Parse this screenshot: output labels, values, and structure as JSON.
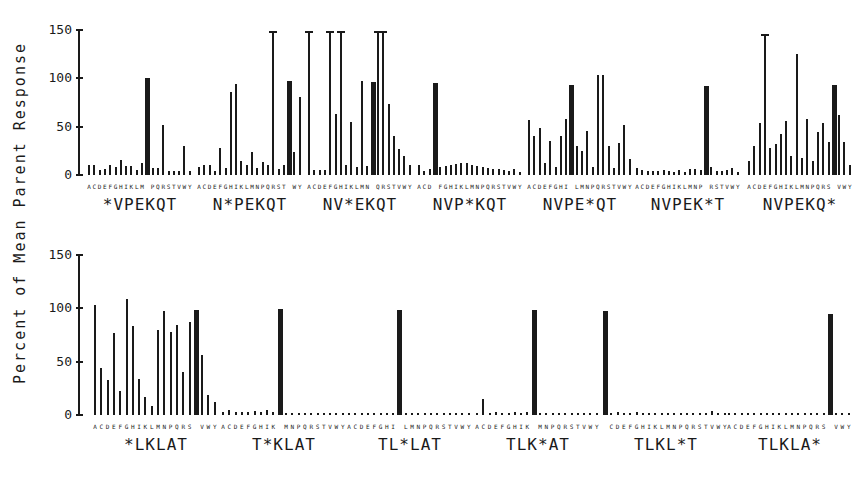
{
  "y_axis_label": "Percent of Mean Parent Response",
  "y_ticks": [
    "0",
    "50",
    "100",
    "150"
  ],
  "amino_acids": [
    "A",
    "C",
    "D",
    "E",
    "F",
    "G",
    "H",
    "I",
    "K",
    "L",
    "M",
    "N",
    "P",
    "Q",
    "R",
    "S",
    "T",
    "V",
    "W",
    "Y"
  ],
  "chart_data": {
    "type": "bar",
    "title": "",
    "ylabel": "Percent of Mean Parent Response",
    "xlabel": "",
    "ylim": [
      0,
      150
    ],
    "grid": false,
    "categories": [
      "A",
      "C",
      "D",
      "E",
      "F",
      "G",
      "H",
      "I",
      "K",
      "L",
      "M",
      "N",
      "P",
      "Q",
      "R",
      "S",
      "T",
      "V",
      "W",
      "Y"
    ],
    "panels": [
      {
        "row": 1,
        "label": "*VPEKQT",
        "native": "N",
        "values": [
          10,
          10,
          5,
          6,
          10,
          8,
          15,
          9,
          9,
          5,
          12,
          100,
          7,
          7,
          52,
          4,
          4,
          4,
          30,
          4
        ]
      },
      {
        "row": 1,
        "label": "N*PEKQT",
        "native": "V",
        "values": [
          8,
          10,
          10,
          4,
          28,
          7,
          86,
          94,
          14,
          10,
          24,
          7,
          13,
          10,
          148,
          6,
          10,
          97,
          24,
          80
        ]
      },
      {
        "row": 1,
        "label": "NV*EKQT",
        "native": "P",
        "values": [
          148,
          5,
          5,
          5,
          148,
          63,
          148,
          10,
          55,
          8,
          97,
          9,
          96,
          148,
          148,
          73,
          40,
          27,
          20,
          10
        ]
      },
      {
        "row": 1,
        "label": "NVP*KQT",
        "native": "E",
        "values": [
          10,
          4,
          6,
          95,
          8,
          9,
          10,
          11,
          12,
          12,
          10,
          9,
          8,
          7,
          6,
          6,
          5,
          4,
          6,
          3
        ]
      },
      {
        "row": 1,
        "label": "NVPE*QT",
        "native": "K",
        "values": [
          57,
          40,
          48,
          12,
          35,
          8,
          40,
          58,
          93,
          30,
          25,
          45,
          8,
          103,
          103,
          30,
          7,
          33,
          52,
          17
        ]
      },
      {
        "row": 1,
        "label": "NVPEK*T",
        "native": "Q",
        "values": [
          7,
          5,
          4,
          4,
          4,
          5,
          4,
          3,
          5,
          3,
          6,
          6,
          5,
          92,
          8,
          4,
          4,
          5,
          7,
          3
        ]
      },
      {
        "row": 1,
        "label": "NVPEKQ*",
        "native": "T",
        "values": [
          14,
          30,
          54,
          145,
          28,
          32,
          42,
          56,
          20,
          125,
          18,
          58,
          14,
          44,
          54,
          34,
          93,
          62,
          34,
          10
        ]
      },
      {
        "row": 2,
        "label": "*LKLAT",
        "native": "T",
        "values": [
          103,
          44,
          33,
          77,
          22,
          108,
          83,
          34,
          17,
          8,
          79,
          97,
          78,
          84,
          40,
          87,
          98,
          56,
          19,
          12
        ]
      },
      {
        "row": 2,
        "label": "T*KLAT",
        "native": "L",
        "values": [
          3,
          5,
          3,
          3,
          3,
          4,
          3,
          5,
          3,
          99,
          2,
          2,
          2,
          2,
          2,
          2,
          2,
          2,
          2,
          2
        ]
      },
      {
        "row": 2,
        "label": "TL*LAT",
        "native": "K",
        "values": [
          2,
          2,
          2,
          2,
          2,
          2,
          2,
          2,
          98,
          2,
          2,
          2,
          2,
          2,
          2,
          2,
          2,
          2,
          2,
          2
        ]
      },
      {
        "row": 2,
        "label": "TLK*AT",
        "native": "L",
        "values": [
          2,
          15,
          2,
          3,
          2,
          2,
          3,
          2,
          3,
          98,
          2,
          2,
          2,
          2,
          2,
          2,
          2,
          2,
          2,
          2
        ]
      },
      {
        "row": 2,
        "label": "TLKL*T",
        "native": "A",
        "values": [
          97,
          2,
          3,
          2,
          2,
          3,
          2,
          2,
          2,
          2,
          2,
          2,
          2,
          2,
          2,
          2,
          2,
          4,
          2,
          2
        ]
      },
      {
        "row": 2,
        "label": "TLKLA*",
        "native": "T",
        "values": [
          2,
          2,
          2,
          2,
          2,
          2,
          2,
          2,
          2,
          2,
          2,
          2,
          2,
          2,
          2,
          2,
          94,
          2,
          2,
          2
        ]
      }
    ]
  }
}
